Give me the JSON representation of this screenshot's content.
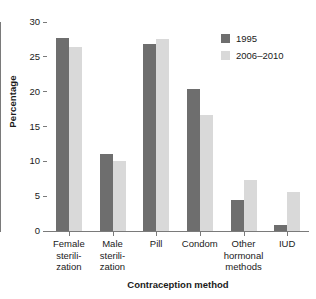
{
  "chart_data": {
    "type": "bar",
    "title": "",
    "xlabel": "Contraception method",
    "ylabel": "Percentage",
    "ylim": [
      0,
      30
    ],
    "yticks": [
      0,
      5,
      10,
      15,
      20,
      25,
      30
    ],
    "grid": false,
    "legend_position": "top-right",
    "categories": [
      "Female\nsterili-\nzation",
      "Male\nsterili-\nzation",
      "Pill",
      "Condom",
      "Other\nhormonal\nmethods",
      "IUD"
    ],
    "series": [
      {
        "name": "1995",
        "color": "#6e6e6e",
        "values": [
          27.7,
          11.0,
          26.9,
          20.4,
          4.4,
          0.8
        ]
      },
      {
        "name": "2006–2010",
        "color": "#d9d9d9",
        "values": [
          26.4,
          10.0,
          27.5,
          16.6,
          7.3,
          5.6
        ]
      }
    ]
  }
}
